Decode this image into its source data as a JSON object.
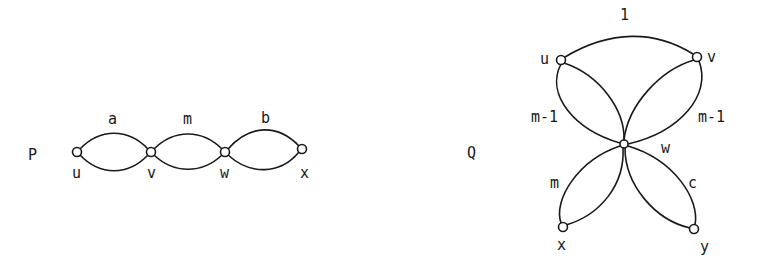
{
  "graphs": [
    {
      "name": "P",
      "vertices": [
        {
          "id": "u",
          "label": "u"
        },
        {
          "id": "v",
          "label": "v"
        },
        {
          "id": "w",
          "label": "w"
        },
        {
          "id": "x",
          "label": "x"
        }
      ],
      "edges": [
        {
          "from": "u",
          "to": "v",
          "label": "a",
          "type": "double-edge"
        },
        {
          "from": "v",
          "to": "w",
          "label": "m",
          "type": "double-edge"
        },
        {
          "from": "w",
          "to": "x",
          "label": "b",
          "type": "double-edge"
        }
      ]
    },
    {
      "name": "Q",
      "vertices": [
        {
          "id": "u",
          "label": "u"
        },
        {
          "id": "v",
          "label": "v"
        },
        {
          "id": "w",
          "label": "w"
        },
        {
          "id": "x",
          "label": "x"
        },
        {
          "id": "y",
          "label": "y"
        }
      ],
      "edges": [
        {
          "from": "u",
          "to": "v",
          "label": "1",
          "type": "single-edge"
        },
        {
          "from": "u",
          "to": "w",
          "label": "m-1",
          "type": "double-edge"
        },
        {
          "from": "v",
          "to": "w",
          "label": "m-1",
          "type": "double-edge"
        },
        {
          "from": "w",
          "to": "x",
          "label": "m",
          "type": "double-edge"
        },
        {
          "from": "w",
          "to": "y",
          "label": "c",
          "type": "double-edge"
        }
      ]
    }
  ]
}
